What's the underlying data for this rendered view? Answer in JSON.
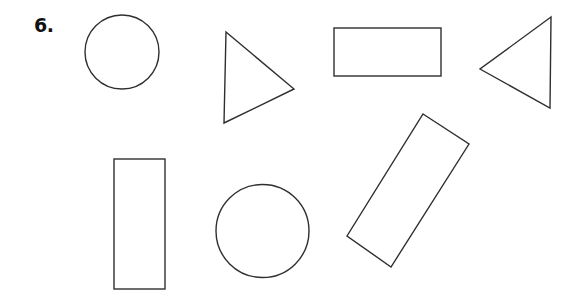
{
  "problem": {
    "number_label": "6."
  },
  "style": {
    "stroke_color": "#2f2f2f",
    "background": "#ffffff"
  },
  "shapes": [
    {
      "type": "circle",
      "name": "circle-top-left",
      "cx": 122,
      "cy": 52,
      "r": 37
    },
    {
      "type": "triangle",
      "name": "triangle-pointing-right",
      "points": "226,32 294,89 224,123"
    },
    {
      "type": "rectangle",
      "name": "rectangle-horizontal",
      "x": 334,
      "y": 28,
      "width": 107,
      "height": 48
    },
    {
      "type": "triangle",
      "name": "triangle-pointing-left",
      "points": "551,17 480,69 550,108"
    },
    {
      "type": "rectangle",
      "name": "rectangle-vertical",
      "x": 114,
      "y": 159,
      "width": 51,
      "height": 130
    },
    {
      "type": "circle",
      "name": "circle-bottom",
      "cx": 262.5,
      "cy": 231,
      "r": 46.5
    },
    {
      "type": "rectangle-rotated",
      "name": "rectangle-tilted",
      "points": "423,114 469,144 391,267 347,236"
    }
  ]
}
